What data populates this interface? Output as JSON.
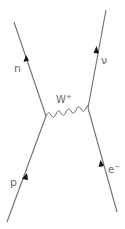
{
  "diagram": {
    "type": "feynman",
    "colors": {
      "line": "#6e6e6e",
      "arrow": "#111111",
      "label": "#6a6a6a",
      "background": "#ffffff"
    },
    "particles": {
      "neutron": {
        "label": "n"
      },
      "neutrino": {
        "label": "ν"
      },
      "proton": {
        "label": "p"
      },
      "electron": {
        "label": "e",
        "superscript": "−"
      },
      "boson": {
        "label": "W",
        "superscript": "+"
      }
    }
  }
}
